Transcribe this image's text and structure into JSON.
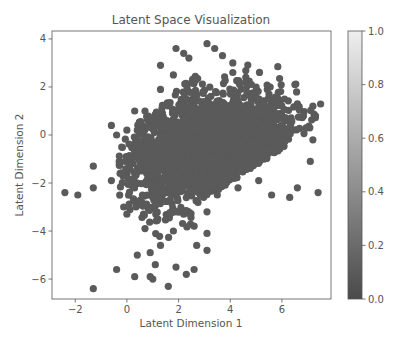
{
  "chart_data": {
    "type": "scatter",
    "title": "Latent Space Visualization",
    "xlabel": "Latent Dimension 1",
    "ylabel": "Latent Dimension 2",
    "xlim": [
      -2.9,
      7.9
    ],
    "ylim": [
      -6.83,
      4.33
    ],
    "xticks": [
      -2,
      0,
      2,
      4,
      6
    ],
    "yticks": [
      -6,
      -4,
      -2,
      0,
      2,
      4
    ],
    "grid": false,
    "point_color": "#5a5a5a",
    "point_radius": 3.6,
    "core": {
      "center": [
        3.3,
        -0.6
      ],
      "spread": [
        1.6,
        1.15
      ],
      "count": 2600,
      "bounds": {
        "xmin": -0.3,
        "xmax": 7.5,
        "ymin": -4.6,
        "ymax": 3.4
      }
    },
    "outliers": [
      [
        -2.4,
        -2.4
      ],
      [
        -1.9,
        -2.5
      ],
      [
        -1.3,
        -1.3
      ],
      [
        -1.3,
        -2.2
      ],
      [
        -1.3,
        -6.4
      ],
      [
        -0.6,
        -1.9
      ],
      [
        0.4,
        -2.0
      ],
      [
        0.0,
        -3.3
      ],
      [
        -0.4,
        -5.6
      ],
      [
        0.4,
        -5.0
      ],
      [
        0.3,
        -5.9
      ],
      [
        1.0,
        -6.0
      ],
      [
        1.6,
        -6.3
      ],
      [
        0.9,
        -4.9
      ],
      [
        1.1,
        -5.4
      ],
      [
        0.9,
        -5.9
      ],
      [
        1.9,
        -5.5
      ],
      [
        2.3,
        -5.8
      ],
      [
        2.6,
        -5.6
      ],
      [
        3.1,
        -4.8
      ],
      [
        3.1,
        -4.1
      ],
      [
        2.7,
        -4.6
      ],
      [
        -0.6,
        0.4
      ],
      [
        -0.4,
        0.0
      ],
      [
        -0.2,
        -0.5
      ],
      [
        0.0,
        0.2
      ],
      [
        0.4,
        0.2
      ],
      [
        0.3,
        1.0
      ],
      [
        0.7,
        1.0
      ],
      [
        1.3,
        1.9
      ],
      [
        1.3,
        2.9
      ],
      [
        1.9,
        3.6
      ],
      [
        2.2,
        3.4
      ],
      [
        1.8,
        2.5
      ],
      [
        2.4,
        3.2
      ],
      [
        3.1,
        3.8
      ],
      [
        3.4,
        3.6
      ],
      [
        3.7,
        3.3
      ],
      [
        4.1,
        3.0
      ],
      [
        4.1,
        2.6
      ],
      [
        4.6,
        2.4
      ],
      [
        5.0,
        2.0
      ],
      [
        5.5,
        1.7
      ],
      [
        6.1,
        1.5
      ],
      [
        6.6,
        1.3
      ],
      [
        7.2,
        1.2
      ],
      [
        7.3,
        0.8
      ],
      [
        7.2,
        -0.2
      ],
      [
        7.1,
        -1.1
      ],
      [
        7.4,
        -2.4
      ],
      [
        6.6,
        -2.2
      ],
      [
        6.3,
        -2.6
      ],
      [
        5.6,
        -2.5
      ],
      [
        5.1,
        -1.9
      ],
      [
        4.3,
        -2.2
      ],
      [
        3.5,
        -2.5
      ],
      [
        3.1,
        -3.2
      ],
      [
        2.6,
        -3.8
      ],
      [
        2.2,
        -3.3
      ],
      [
        1.8,
        -4.0
      ],
      [
        1.3,
        -4.6
      ],
      [
        -0.3,
        -1.1
      ],
      [
        0.5,
        -2.9
      ],
      [
        0.7,
        -3.9
      ],
      [
        1.2,
        -3.5
      ]
    ],
    "colorbar": {
      "ticks": [
        0.0,
        0.2,
        0.4,
        0.6,
        0.8,
        1.0
      ],
      "tick_labels": [
        "0.0",
        "0.2",
        "0.4",
        "0.6",
        "0.8",
        "1.0"
      ],
      "range": [
        0.0,
        1.0
      ],
      "color_low": "#4a4a4a",
      "color_high": "#eeeeee"
    }
  }
}
